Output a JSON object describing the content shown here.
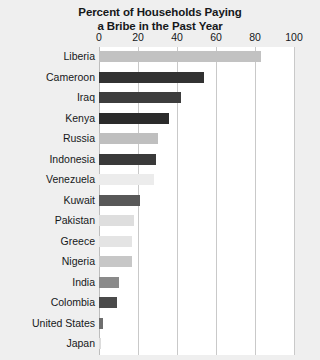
{
  "chart_data": {
    "type": "bar",
    "orientation": "horizontal",
    "title": "Percent of Households Paying a Bribe in the Past Year",
    "title_lines": [
      "Percent of Households Paying",
      "a Bribe in the Past Year"
    ],
    "xlabel": "",
    "ylabel": "",
    "xlim": [
      0,
      100
    ],
    "xticks": [
      0,
      20,
      40,
      60,
      80,
      100
    ],
    "xtick_labels": [
      "0",
      "20",
      "40",
      "60",
      "80",
      "100"
    ],
    "grid": true,
    "legend": "none",
    "categories": [
      "Liberia",
      "Cameroon",
      "Iraq",
      "Kenya",
      "Russia",
      "Indonesia",
      "Venezuela",
      "Kuwait",
      "Pakistan",
      "Greece",
      "Nigeria",
      "India",
      "Colombia",
      "United States",
      "Japan"
    ],
    "values": [
      83,
      54,
      42,
      36,
      30,
      29,
      28,
      21,
      18,
      17,
      17,
      10,
      9,
      2,
      1
    ],
    "bar_colors": [
      "#c2c2c2",
      "#323232",
      "#3d3d3d",
      "#2b2b2b",
      "#bfbfbf",
      "#3a3a3a",
      "#ececec",
      "#585858",
      "#dedede",
      "#e4e4e4",
      "#c7c7c7",
      "#8a8a8a",
      "#4a4a4a",
      "#6e6e6e",
      "#dcdcdc"
    ]
  },
  "colors": {
    "background": "#efefef",
    "plot_background": "#ffffff",
    "gridline": "#c9c9c9",
    "axis": "#bdbdbd",
    "text": "#16181a"
  }
}
